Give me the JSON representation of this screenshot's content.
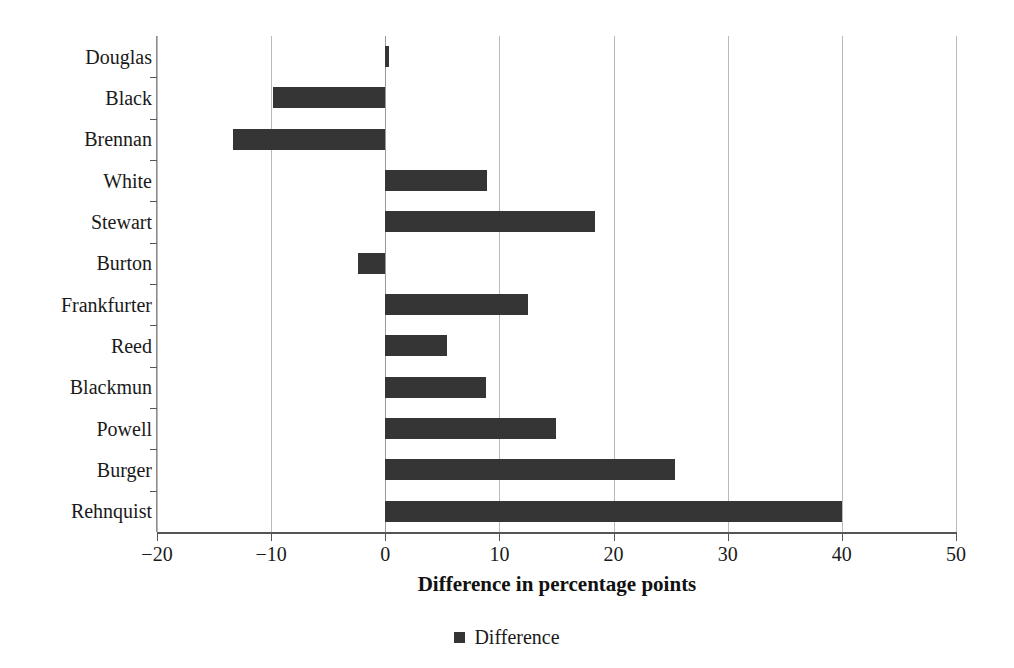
{
  "chart_data": {
    "type": "bar",
    "orientation": "horizontal",
    "title": "",
    "xlabel": "Difference in percentage points",
    "ylabel": "",
    "xlim": [
      -20,
      50
    ],
    "xticks": [
      -20,
      -10,
      0,
      10,
      20,
      30,
      40,
      50
    ],
    "xtick_labels": [
      "−20",
      "−10",
      "0",
      "10",
      "20",
      "30",
      "40",
      "50"
    ],
    "grid": "vertical",
    "legend_position": "bottom",
    "bar_color": "#353535",
    "gridline_color": "#b9b9b9",
    "axis_color": "#555555",
    "categories": [
      "Douglas",
      "Black",
      "Brennan",
      "White",
      "Stewart",
      "Burton",
      "Frankfurter",
      "Reed",
      "Blackmun",
      "Powell",
      "Burger",
      "Rehnquist"
    ],
    "series": [
      {
        "name": "Difference",
        "values": [
          0.3,
          -9.8,
          -13.3,
          8.9,
          18.4,
          -2.4,
          12.5,
          5.4,
          8.8,
          15.0,
          25.4,
          40.0
        ]
      }
    ],
    "legend": [
      "Difference"
    ]
  }
}
